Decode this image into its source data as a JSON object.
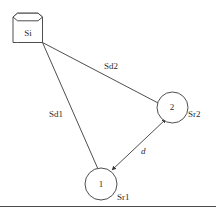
{
  "figure": {
    "type": "node-link-diagram",
    "background_color": "#ffffff",
    "stroke_color": "#3a3a3a",
    "text_color": "#2b2b2b"
  },
  "source": {
    "shape": "cylinder",
    "label": "Si"
  },
  "nodes": [
    {
      "id": "1",
      "number": "1",
      "label": "Sr1"
    },
    {
      "id": "2",
      "number": "2",
      "label": "Sr2"
    }
  ],
  "edges": [
    {
      "from": "Si",
      "to": "1",
      "label": "Sd1",
      "arrow": "none"
    },
    {
      "from": "Si",
      "to": "2",
      "label": "Sd2",
      "arrow": "none"
    },
    {
      "from": "1",
      "to": "2",
      "label": "d",
      "arrow": "both",
      "italic": true
    }
  ],
  "rule": {
    "present": true,
    "label": "horizontal-rule"
  }
}
